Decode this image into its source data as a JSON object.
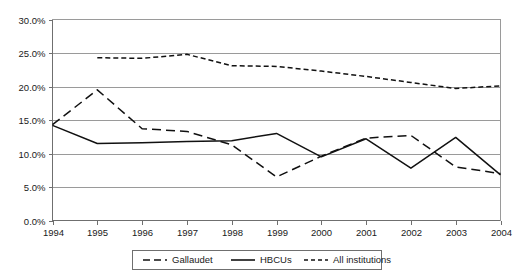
{
  "chart_data": {
    "type": "line",
    "title": "",
    "subtitle": "",
    "xlabel": "",
    "ylabel": "",
    "x": [
      1994,
      1995,
      1996,
      1997,
      1998,
      1999,
      2000,
      2001,
      2002,
      2003,
      2004
    ],
    "categories": [
      "1994",
      "1995",
      "1996",
      "1997",
      "1998",
      "1999",
      "2000",
      "2001",
      "2002",
      "2003",
      "2004"
    ],
    "xlim": [
      1994,
      2004
    ],
    "ylim": [
      0,
      30
    ],
    "ytick_values": [
      0,
      5,
      10,
      15,
      20,
      25,
      30
    ],
    "ytick_labels": [
      "0.0%",
      "5.0%",
      "10.0%",
      "15.0%",
      "20.0%",
      "25.0%",
      "30.0%"
    ],
    "grid": true,
    "grid_axis": "y",
    "legend_position": "bottom",
    "series": [
      {
        "name": "Gallaudet",
        "dash": "long-dash",
        "color": "#111111",
        "values": [
          14.3,
          19.5,
          13.7,
          13.3,
          11.3,
          6.5,
          9.6,
          12.3,
          12.7,
          8.0,
          7.0
        ]
      },
      {
        "name": "HBCUs",
        "dash": "solid",
        "color": "#111111",
        "values": [
          14.2,
          11.5,
          11.6,
          11.8,
          11.9,
          13.0,
          9.5,
          12.2,
          7.8,
          12.4,
          6.8
        ]
      },
      {
        "name": "All institutions",
        "dash": "short-dash",
        "color": "#111111",
        "values": [
          null,
          24.3,
          24.2,
          24.8,
          23.1,
          23.0,
          22.3,
          21.5,
          20.6,
          19.7,
          20.1
        ]
      }
    ]
  },
  "legend": {
    "items": [
      {
        "label": "Gallaudet",
        "dash": "long-dash"
      },
      {
        "label": "HBCUs",
        "dash": "solid"
      },
      {
        "label": "All institutions",
        "dash": "short-dash"
      }
    ]
  },
  "axes": {
    "y_labels": [
      "30.0%",
      "25.0%",
      "20.0%",
      "15.0%",
      "10.0%",
      "5.0%",
      "0.0%"
    ],
    "x_labels": [
      "1994",
      "1995",
      "1996",
      "1997",
      "1998",
      "1999",
      "2000",
      "2001",
      "2002",
      "2003",
      "2004"
    ]
  }
}
